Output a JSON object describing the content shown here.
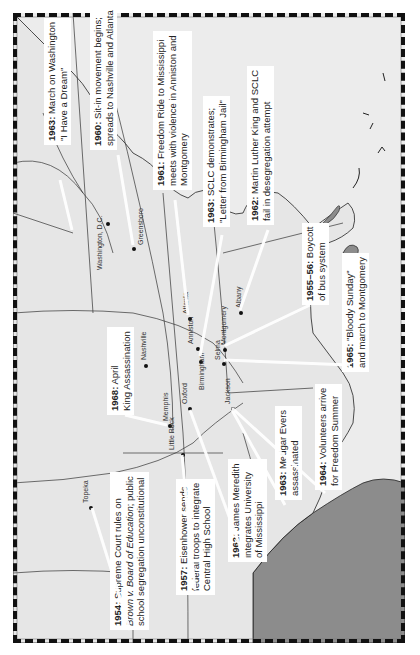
{
  "map": {
    "title": "Civil Rights Movement Events",
    "orientation": "rotated-90-ccw",
    "colors": {
      "land": "#e8e8e8",
      "water": "#ececec",
      "ocean_dark": "#8c8c8c",
      "border": "#111111",
      "lines": "#333333"
    }
  },
  "events": [
    {
      "year": "1954:",
      "text_lines": [
        "Supreme Court rules on",
        "Brown v. Board of Education; public",
        "school segregation unconstitutional"
      ],
      "italic_part": "Brown v. Board of Education"
    },
    {
      "year": "1955–56:",
      "text_lines": [
        "Boycott",
        "of bus system"
      ]
    },
    {
      "year": "1957:",
      "text_lines": [
        "Eisenhower sends",
        "federal troops to integrate",
        "Central High School"
      ]
    },
    {
      "year": "1960:",
      "text_lines": [
        "Sit-in movement begins;",
        "spreads to Nashville and Atlanta"
      ]
    },
    {
      "year": "1961:",
      "text_lines": [
        "Freedom Ride to Mississippi",
        "meets with violence in Anniston and",
        "Montgomery"
      ]
    },
    {
      "year": "1962:",
      "text_lines": [
        "Martin Luther King and SCLC",
        "fail in desegregation attempt"
      ]
    },
    {
      "year": "1962:",
      "text_lines": [
        "James Meredith",
        "integrates University",
        "of Mississippi"
      ]
    },
    {
      "year": "1963:",
      "text_lines": [
        "March on Washington",
        "\"I Have a Dream\""
      ]
    },
    {
      "year": "1963:",
      "text_lines": [
        "SCLC demonstrates;",
        "\"Letter from Birmingham Jail\""
      ]
    },
    {
      "year": "1963:",
      "text_lines": [
        "Medgar Evers",
        "assassinated"
      ]
    },
    {
      "year": "1964:",
      "text_lines": [
        "Volunteers arrive",
        "for Freedom Summer"
      ]
    },
    {
      "year": "1965:",
      "text_lines": [
        "\"Bloody Sunday\"",
        "and march to Montgomery"
      ]
    },
    {
      "year": "1968:",
      "text_lines": [
        "April",
        "King Assassination"
      ]
    }
  ],
  "cities": [
    "Washington, D.C.",
    "Greensboro",
    "Nashville",
    "Atlanta",
    "Memphis",
    "Oxford",
    "Anniston",
    "Birmingham",
    "Selma",
    "Montgomery",
    "Albany",
    "Jackson",
    "Little Rock",
    "Topeka"
  ]
}
